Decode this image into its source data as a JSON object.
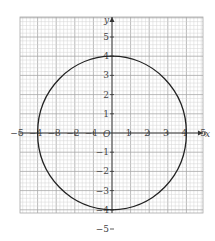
{
  "chart_data": {
    "type": "line",
    "title": "",
    "xlabel": "x",
    "ylabel": "y",
    "origin_label": "O",
    "xlim": [
      -5,
      5
    ],
    "ylim": [
      -5,
      5
    ],
    "grid": true,
    "minor_grid_per_unit": 5,
    "x_ticks": [
      -5,
      -4,
      -3,
      -2,
      -1,
      1,
      2,
      3,
      4,
      5
    ],
    "x_tick_labels": [
      "−5",
      "−4",
      "−3",
      "−2",
      "−1",
      "1",
      "2",
      "3",
      "4",
      "5"
    ],
    "y_ticks": [
      -5,
      -4,
      -3,
      -2,
      -1,
      1,
      2,
      3,
      4,
      5
    ],
    "y_tick_labels": [
      "−5",
      "−4",
      "−3",
      "−2",
      "−1",
      "1",
      "2",
      "3",
      "4",
      "5"
    ],
    "series": [
      {
        "name": "circle x^2 + y^2 = 16",
        "shape": "circle",
        "center": [
          0,
          0
        ],
        "radius": 4,
        "color": "#222222"
      }
    ],
    "legend": null
  },
  "colors": {
    "grid_minor": "#d4d4d4",
    "grid_major": "#a8a8a8",
    "axis": "#333333",
    "curve": "#222222",
    "text": "#444444"
  }
}
